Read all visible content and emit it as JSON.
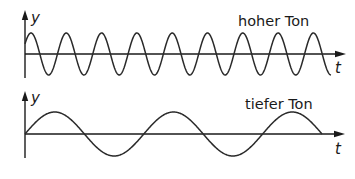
{
  "diagrams": [
    {
      "id": "high",
      "title": "hoher Ton",
      "y_label": "y",
      "x_label": "t",
      "origin_x": 25,
      "baseline_y": 54,
      "axis_top": 10,
      "axis_bottom": 78,
      "x_axis_end": 346,
      "amplitude": 21,
      "period": 35.3,
      "phase_peak_x": 31,
      "wave_start_x": 25,
      "wave_end_x": 331,
      "title_x": 238,
      "title_y": 26,
      "ylabel_x": 31,
      "ylabel_y": 23,
      "xlabel_x": 335,
      "xlabel_y": 73
    },
    {
      "id": "low",
      "title": "tiefer Ton",
      "y_label": "y",
      "x_label": "t",
      "origin_x": 25,
      "baseline_y": 134,
      "axis_top": 91,
      "axis_bottom": 158,
      "x_axis_end": 345,
      "amplitude": 22,
      "period": 118.8,
      "phase_peak_x": 54.7,
      "wave_start_x": 25,
      "wave_end_x": 322,
      "title_x": 245,
      "title_y": 109,
      "ylabel_x": 31,
      "ylabel_y": 103,
      "xlabel_x": 335,
      "xlabel_y": 154
    }
  ],
  "colors": {
    "background": "#ffffff",
    "stroke": "#1a1a1a"
  }
}
